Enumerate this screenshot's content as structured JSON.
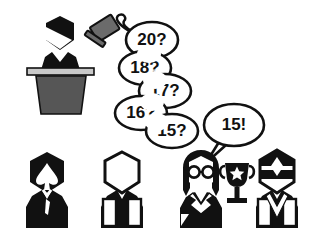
{
  "scene": {
    "title": "Auction descending bid scene",
    "width": 324,
    "height": 236,
    "background_color": "#ffffff"
  },
  "colors": {
    "ink": "#111111",
    "outline": "#000000",
    "paper": "#ffffff",
    "podium_body": "#565656",
    "podium_top": "#c9c9c9",
    "gavel": "#666666",
    "gavel_dark": "#3f3f3f"
  },
  "auctioneer": {
    "label": "auctioneer",
    "podium_label": "podium",
    "gavel_label": "gavel"
  },
  "bids": [
    {
      "id": "bid-20",
      "text": "20?",
      "cx": 152,
      "cy": 40,
      "rx": 26,
      "ry": 18
    },
    {
      "id": "bid-18",
      "text": "18?",
      "cx": 145,
      "cy": 68,
      "rx": 26,
      "ry": 17
    },
    {
      "id": "bid-17",
      "text": "17?",
      "cx": 165,
      "cy": 91,
      "rx": 26,
      "ry": 17
    },
    {
      "id": "bid-16",
      "text": "16?",
      "cx": 141,
      "cy": 113,
      "rx": 26,
      "ry": 17
    },
    {
      "id": "bid-15q",
      "text": "15?",
      "cx": 172,
      "cy": 131,
      "rx": 26,
      "ry": 17
    }
  ],
  "winning_bid": {
    "id": "bid-15",
    "text": "15!",
    "cx": 234,
    "cy": 125,
    "rx": 30,
    "ry": 21
  },
  "bidders": [
    {
      "id": "bidder-1",
      "label": "bidder-spade",
      "x": 47,
      "style": "solid-dark"
    },
    {
      "id": "bidder-2",
      "label": "bidder-blank",
      "x": 122,
      "style": "outline"
    },
    {
      "id": "bidder-3",
      "label": "bidder-winner-glasses",
      "x": 201,
      "style": "glasses-winner"
    },
    {
      "id": "bidder-4",
      "label": "bidder-visor",
      "x": 277,
      "style": "visor"
    }
  ],
  "trophy": {
    "label": "trophy",
    "x": 237,
    "y": 182,
    "star": "★"
  }
}
